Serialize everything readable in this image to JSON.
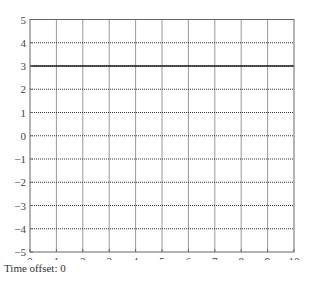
{
  "chart_data": {
    "type": "line",
    "title": "",
    "xlabel": "",
    "ylabel": "",
    "xlim": [
      0,
      10
    ],
    "ylim": [
      -5,
      5
    ],
    "x_ticks": [
      "0",
      "1",
      "2",
      "3",
      "4",
      "5",
      "6",
      "7",
      "8",
      "9",
      "10"
    ],
    "y_ticks": [
      "5",
      "4",
      "3",
      "2",
      "1",
      "0",
      "−1",
      "−2",
      "−3",
      "−4",
      "−5"
    ],
    "grid": true,
    "grid_style": "dotted",
    "series": [
      {
        "name": "constant",
        "x": [
          0,
          10
        ],
        "y": [
          3,
          3
        ],
        "color": "#222222"
      }
    ],
    "legend": null
  },
  "caption": {
    "time_offset_label": "Time offset: 0"
  },
  "colors": {
    "axis": "#555555",
    "grid": "#333333",
    "line": "#222222"
  }
}
